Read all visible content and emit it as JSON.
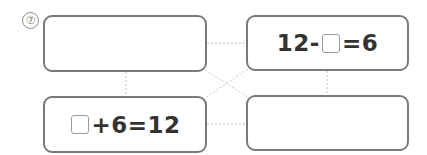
{
  "problem_number": "⑦",
  "boxes": {
    "top_left": {
      "left": "",
      "blank": false,
      "right": ""
    },
    "top_right": {
      "left": "12-",
      "blank": true,
      "right": "=6"
    },
    "bottom_left": {
      "left": "",
      "blank": true,
      "right": "+6=12"
    },
    "bottom_right": {
      "left": "",
      "blank": false,
      "right": ""
    }
  },
  "connectors": {
    "style": "dashed",
    "color": "#c4c4c4",
    "links": [
      "top_left-top_right",
      "top_left-bottom_left",
      "top_right-bottom_right",
      "bottom_left-bottom_right",
      "top_left-bottom_right",
      "top_right-bottom_left"
    ]
  }
}
